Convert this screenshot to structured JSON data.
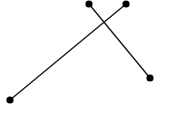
{
  "figure": {
    "title": "",
    "kind": "line-segment-diagram",
    "canvas": {
      "width": 173,
      "height": 115,
      "background_color": "#ffffff"
    },
    "style": {
      "line_color": "#1a1a1a",
      "line_width": 1.4,
      "marker_color": "#000000",
      "marker_shape": "filled-circle",
      "marker_radius": 3.6
    },
    "points": [
      {
        "id": "p1",
        "label": "",
        "x": 89,
        "y": 4
      },
      {
        "id": "p2",
        "label": "",
        "x": 126,
        "y": 4
      },
      {
        "id": "p3",
        "label": "",
        "x": 150,
        "y": 78
      },
      {
        "id": "p4",
        "label": "",
        "x": 10,
        "y": 100
      }
    ],
    "segments": [
      {
        "id": "segment-long",
        "from": "p4",
        "to": "p2",
        "x1": 10,
        "y1": 100,
        "x2": 126,
        "y2": 4
      },
      {
        "id": "segment-short",
        "from": "p1",
        "to": "p3",
        "x1": 89,
        "y1": 4,
        "x2": 150,
        "y2": 78
      }
    ],
    "intersections": [
      {
        "id": "crossing",
        "x": 106,
        "y": 21
      }
    ]
  },
  "chart_data": {
    "type": "scatter",
    "title": "",
    "xlabel": "",
    "ylabel": "",
    "grid": false,
    "legend": "none",
    "xlim": [
      0,
      173
    ],
    "ylim": [
      0,
      115
    ],
    "points": [
      {
        "x": 89,
        "y": 4
      },
      {
        "x": 126,
        "y": 4
      },
      {
        "x": 150,
        "y": 78
      },
      {
        "x": 10,
        "y": 100
      }
    ],
    "series": [
      {
        "name": "segment-long",
        "x": [
          10,
          126
        ],
        "y": [
          100,
          4
        ]
      },
      {
        "name": "segment-short",
        "x": [
          89,
          150
        ],
        "y": [
          4,
          78
        ]
      }
    ]
  }
}
